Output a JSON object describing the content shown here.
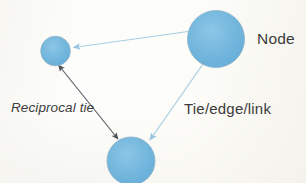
{
  "diagram": {
    "background_color": "#fdfdfb",
    "node_fill_color": "#6eb4dd",
    "node_stroke_color": "#86a9c4",
    "light_edge_color": "#a8cfe4",
    "dark_edge_color": "#5c5f63",
    "label_color": "#3c3c3c",
    "nodes": [
      {
        "id": "node-large",
        "label": "",
        "cx": 216,
        "cy": 39,
        "r": 29
      },
      {
        "id": "node-small",
        "label": "",
        "cx": 55.5,
        "cy": 51,
        "r": 15
      },
      {
        "id": "node-bottom",
        "label": "",
        "cx": 131,
        "cy": 160,
        "r": 24
      }
    ],
    "edges": [
      {
        "id": "edge-large-to-small",
        "type": "directed",
        "color": "#a8cfe4",
        "from": "node-large",
        "to": "node-small"
      },
      {
        "id": "edge-large-to-bottom",
        "type": "directed",
        "color": "#a8cfe4",
        "from": "node-large",
        "to": "node-bottom"
      },
      {
        "id": "edge-small-bottom-reciprocal",
        "type": "bidirectional",
        "color": "#5c5f63",
        "from": "node-small",
        "to": "node-bottom"
      }
    ],
    "labels": {
      "node": "Node",
      "reciprocal_tie": "Reciprocal tie",
      "tie_edge_link": "Tie/edge/link"
    }
  }
}
